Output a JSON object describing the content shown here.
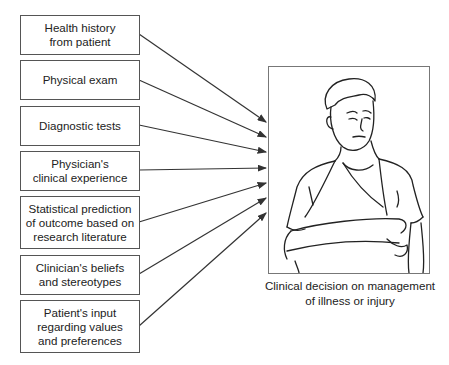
{
  "diagram": {
    "inputs": [
      {
        "label": "Health history\nfrom patient"
      },
      {
        "label": "Physical exam"
      },
      {
        "label": "Diagnostic tests"
      },
      {
        "label": "Physician's\nclinical experience"
      },
      {
        "label": "Statistical prediction\nof outcome based on\nresearch literature"
      },
      {
        "label": "Clinician's beliefs\nand stereotypes"
      },
      {
        "label": "Patient's input\nregarding values\nand preferences"
      }
    ],
    "illustration": {
      "subject": "patient-with-arm-sling-icon"
    },
    "output": {
      "caption": "Clinical decision on management\nof illness or injury"
    },
    "colors": {
      "line": "#333333",
      "border": "#555555"
    }
  }
}
